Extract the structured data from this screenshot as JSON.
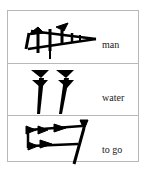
{
  "rows": [
    {
      "icon": "cuneiform-man-icon",
      "label": "man"
    },
    {
      "icon": "cuneiform-water-icon",
      "label": "water"
    },
    {
      "icon": "cuneiform-to-go-icon",
      "label": "to go"
    }
  ],
  "colors": {
    "border": "#b8b8b8",
    "glyph": "#000000"
  }
}
